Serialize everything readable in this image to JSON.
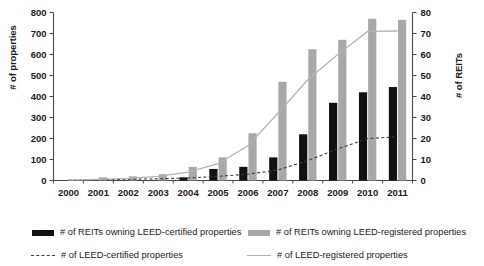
{
  "chart_data": {
    "type": "bar",
    "title": "",
    "subtitle": "",
    "xlabel": "",
    "ylabel": "# of properties",
    "ylabel_right": "# of REITs",
    "categories": [
      "2000",
      "2001",
      "2002",
      "2003",
      "2004",
      "2005",
      "2006",
      "2007",
      "2008",
      "2009",
      "2010",
      "2011"
    ],
    "ylim": [
      0,
      800
    ],
    "ylim_right": [
      0,
      80
    ],
    "yticks": [
      0,
      100,
      200,
      300,
      400,
      500,
      600,
      700,
      800
    ],
    "yticks_right": [
      0,
      10,
      20,
      30,
      40,
      50,
      60,
      70,
      80
    ],
    "grid": false,
    "legend_position": "bottom",
    "series": [
      {
        "name": "# of REITs owning LEED-certified properties",
        "kind": "bar",
        "axis": "right",
        "color": "#111111",
        "values": [
          0,
          0,
          0,
          0,
          1.5,
          5.5,
          6.5,
          11,
          22,
          37,
          42,
          44.5
        ]
      },
      {
        "name": "# of REITs owning LEED-registered properties",
        "kind": "bar",
        "axis": "right",
        "color": "#a8a8a8",
        "values": [
          0,
          1.5,
          2,
          3,
          6.5,
          11,
          22.5,
          47,
          62.5,
          67,
          77,
          76.5
        ]
      },
      {
        "name": "# of LEED-certified properties",
        "kind": "line",
        "style": "dashed",
        "axis": "right",
        "color": "#3a3a3a",
        "values": [
          0.2,
          0.4,
          0.6,
          0.8,
          1.2,
          2.0,
          3.0,
          5.0,
          9.5,
          15.0,
          20.0,
          20.8
        ]
      },
      {
        "name": "# of LEED-registered properties",
        "kind": "line",
        "style": "solid",
        "axis": "right",
        "color": "#b4b4b4",
        "values": [
          0.2,
          0.5,
          1.0,
          2.0,
          4.0,
          8.0,
          16.5,
          32.0,
          48.0,
          60.0,
          71.0,
          71.2
        ]
      }
    ]
  },
  "legend": {
    "items": [
      {
        "label": "# of REITs owning LEED-certified properties",
        "marker": "black-bar-swatch"
      },
      {
        "label": "# of REITs owning LEED-registered properties",
        "marker": "gray-bar-swatch"
      },
      {
        "label": "# of LEED-certified properties",
        "marker": "dashed-line-swatch"
      },
      {
        "label": "# of LEED-registered properties",
        "marker": "solid-gray-line-swatch"
      }
    ]
  }
}
